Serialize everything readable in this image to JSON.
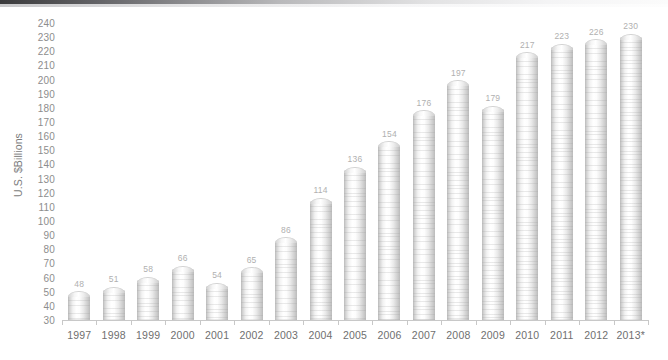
{
  "chart_data": {
    "type": "bar",
    "title": "",
    "xlabel": "",
    "ylabel": "U.S. $Billions",
    "ylim": [
      30,
      240
    ],
    "ytick_step": 10,
    "yticks": [
      240,
      230,
      220,
      210,
      200,
      190,
      180,
      170,
      160,
      150,
      140,
      130,
      120,
      110,
      100,
      90,
      80,
      70,
      60,
      50,
      40,
      30
    ],
    "grid": false,
    "legend": null,
    "categories": [
      "1997",
      "1998",
      "1999",
      "2000",
      "2001",
      "2002",
      "2003",
      "2004",
      "2005",
      "2006",
      "2007",
      "2008",
      "2009",
      "2010",
      "2011",
      "2012",
      "2013*"
    ],
    "values": [
      48,
      51,
      58,
      66,
      54,
      65,
      86,
      114,
      136,
      154,
      176,
      197,
      179,
      217,
      223,
      226,
      230
    ],
    "data_labels": [
      "48",
      "51",
      "58",
      "66",
      "54",
      "65",
      "86",
      "114",
      "136",
      "154",
      "176",
      "197",
      "179",
      "217",
      "223",
      "226",
      "230"
    ],
    "bar_style": "ribbed-glass-cylinder",
    "colors": {
      "bar_light": "#ffffff",
      "bar_mid": "#e6e6e6",
      "bar_edge": "#bdbdbd",
      "axis": "#c8c8c8",
      "tick_text": "#8d8d8d",
      "label_text": "#6f6f6f",
      "value_text": "#b0b0b0",
      "background": "#ffffff"
    }
  }
}
